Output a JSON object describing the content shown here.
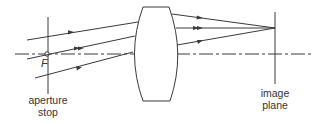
{
  "diagram": {
    "title": "",
    "labels": {
      "focal_point": "F",
      "aperture_stop_line1": "aperture",
      "aperture_stop_line2": "stop",
      "image_plane_line1": "image",
      "image_plane_line2": "plane"
    },
    "elements": [
      "aperture stop",
      "focal point F",
      "optical axis",
      "lens",
      "three rays",
      "image plane"
    ],
    "colors": {
      "line": "#3a3a3a",
      "background": "#ffffff"
    }
  }
}
